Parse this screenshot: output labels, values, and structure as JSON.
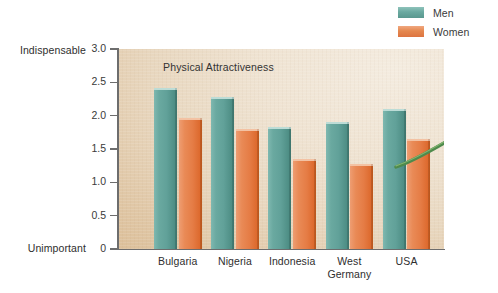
{
  "legend": {
    "items": [
      {
        "label": "Men",
        "color": "#6aa9a0"
      },
      {
        "label": "Women",
        "color": "#e5884f"
      }
    ]
  },
  "axis": {
    "y_top_label": "Indispensable",
    "y_bottom_label": "Unimportant",
    "y_ticks": [
      "3.0",
      "2.5",
      "2.0",
      "1.5",
      "1.0",
      "0.5",
      "0"
    ]
  },
  "decoration": {
    "rose_icon": "rose-illustration"
  },
  "chart_data": {
    "type": "bar",
    "title": "Physical Attractiveness",
    "xlabel": "",
    "ylabel": "",
    "ylim": [
      0,
      3.0
    ],
    "ytick_values": [
      3.0,
      2.5,
      2.0,
      1.5,
      1.0,
      0.5,
      0
    ],
    "ytick_labels": [
      "3.0",
      "2.5",
      "2.0",
      "1.5",
      "1.0",
      "0.5",
      "0"
    ],
    "y_axis_endpoints": {
      "top": "Indispensable",
      "bottom": "Unimportant"
    },
    "grid": false,
    "legend_position": "top-right",
    "categories": [
      "Bulgaria",
      "Nigeria",
      "Indonesia",
      "West Germany",
      "USA"
    ],
    "category_labels": [
      [
        "Bulgaria"
      ],
      [
        "Nigeria"
      ],
      [
        "Indonesia"
      ],
      [
        "West",
        "Germany"
      ],
      [
        "USA"
      ]
    ],
    "series": [
      {
        "name": "Men",
        "color": "#6aa9a0",
        "values": [
          2.42,
          2.28,
          1.83,
          1.9,
          2.1
        ]
      },
      {
        "name": "Women",
        "color": "#e5884f",
        "values": [
          1.97,
          1.8,
          1.35,
          1.28,
          1.65
        ]
      }
    ]
  }
}
